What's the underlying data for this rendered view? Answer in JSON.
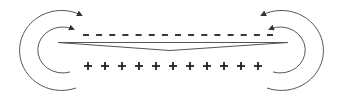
{
  "diagram": {
    "title": "",
    "stroke_color": "#333333",
    "charge_color": "#222222",
    "negative_charges": {
      "symbol": "-",
      "count": 15,
      "y": 35,
      "x_start": 86,
      "x_end": 270
    },
    "positive_charges": {
      "symbol": "+",
      "count": 11,
      "y": 66,
      "x_start": 88,
      "x_end": 258
    },
    "wedge": {
      "left_x": 58,
      "right_x": 288,
      "top_y": 42,
      "belly_y": 51
    },
    "arrows": [
      {
        "side": "left",
        "ring": "outer"
      },
      {
        "side": "left",
        "ring": "inner"
      },
      {
        "side": "right",
        "ring": "outer"
      },
      {
        "side": "right",
        "ring": "inner"
      }
    ]
  }
}
